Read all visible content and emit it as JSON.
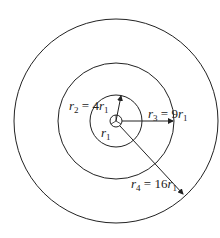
{
  "diagram": {
    "type": "concentric-circles",
    "center": {
      "x": 116,
      "y": 121
    },
    "circles": [
      {
        "name": "r1",
        "radius_px": 6
      },
      {
        "name": "r2",
        "radius_px": 26
      },
      {
        "name": "r3",
        "radius_px": 58
      },
      {
        "name": "r4",
        "radius_px": 102
      }
    ],
    "labels": {
      "r1": {
        "var": "r",
        "sub": "1"
      },
      "r2": {
        "var": "r",
        "sub": "2",
        "eq": " = 4",
        "rhs_var": "r",
        "rhs_sub": "1"
      },
      "r3": {
        "var": "r",
        "sub": "3",
        "eq": " = 9",
        "rhs_var": "r",
        "rhs_sub": "1"
      },
      "r4": {
        "var": "r",
        "sub": "4",
        "eq": " = 16",
        "rhs_var": "r",
        "rhs_sub": "1"
      }
    },
    "colors": {
      "stroke": "#222222",
      "background": "#ffffff"
    }
  }
}
